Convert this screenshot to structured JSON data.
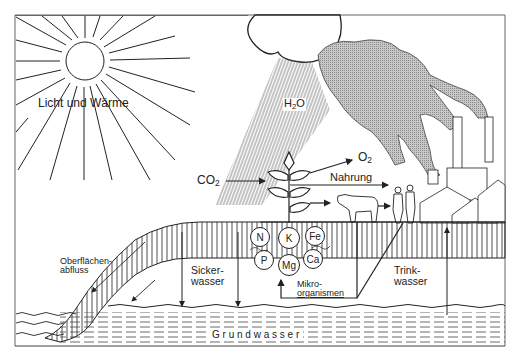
{
  "diagram": {
    "type": "water-and-nutrient-cycle",
    "labels": {
      "sun": "Licht und Wärme",
      "water": "H",
      "water_sub": "2",
      "water_tail": "O",
      "co2": "CO",
      "co2_sub": "2",
      "o2": "O",
      "o2_sub": "2",
      "food": "Nahrung",
      "runoff_line1": "Oberflächen-",
      "runoff_line2": "abfluss",
      "seepage_line1": "Sicker-",
      "seepage_line2": "wasser",
      "drinking_line1": "Trink-",
      "drinking_line2": "wasser",
      "micro_line1": "Mikro-",
      "micro_line2": "organismen",
      "groundwater": "G r u n d w a s s e r"
    },
    "nutrients": [
      "N",
      "K",
      "Fe",
      "P",
      "Mg",
      "Ca"
    ],
    "colors": {
      "line": "#222222",
      "smoke": "#bdbdbd",
      "background": "#ffffff"
    }
  }
}
